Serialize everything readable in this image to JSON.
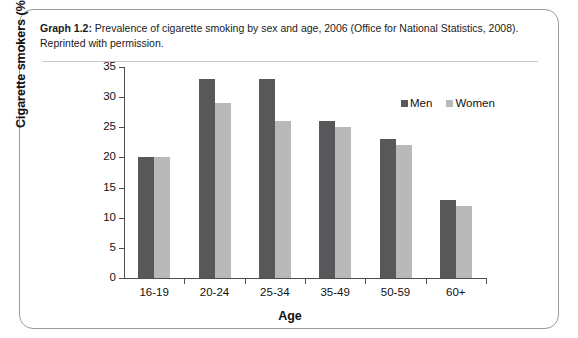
{
  "caption": {
    "label": "Graph 1.2:",
    "text": " Prevalence of cigarette smoking by sex and age, 2006 (Office for National Statistics, 2008). Reprinted with permission."
  },
  "colors": {
    "men": "#58585a",
    "women": "#b9b9b9",
    "axis": "#4d4d4d",
    "frame": "#9a9a9a"
  },
  "chart_data": {
    "type": "bar",
    "title": "",
    "xlabel": "Age",
    "ylabel": "Cigarette smokers (%)",
    "categories": [
      "16-19",
      "20-24",
      "25-34",
      "35-49",
      "50-59",
      "60+"
    ],
    "series": [
      {
        "name": "Men",
        "values": [
          20,
          33,
          33,
          26,
          23,
          13
        ]
      },
      {
        "name": "Women",
        "values": [
          20,
          29,
          26,
          25,
          22,
          12
        ]
      }
    ],
    "ylim": [
      0,
      35
    ],
    "ytick_step": 5,
    "yticks": [
      0,
      5,
      10,
      15,
      20,
      25,
      30,
      35
    ],
    "grid": false,
    "legend_position": "top-right"
  }
}
